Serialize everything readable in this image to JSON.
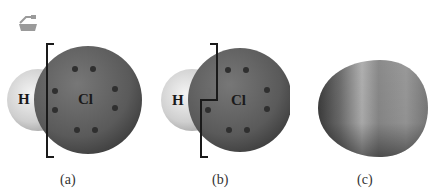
{
  "figure": {
    "logo_icon": "flask-logo-icon",
    "panels": [
      {
        "id": "a",
        "caption": "(a)",
        "atoms": {
          "left": "H",
          "right": "Cl"
        },
        "description": "HCl space-filling model with bracket around Cl; 8 electron dots on Cl"
      },
      {
        "id": "b",
        "caption": "(b)",
        "atoms": {
          "left": "H",
          "right": "Cl"
        },
        "description": "HCl model with stepped bracket including shared electron pair"
      },
      {
        "id": "c",
        "caption": "(c)",
        "description": "Electron density surface of HCl molecule"
      }
    ]
  },
  "colors": {
    "hydrogen": "#d6d6d6",
    "chlorine": "#5e5e5e",
    "dots": "#2f2f2f",
    "bracket": "#1a1a1a",
    "surface_dark": "#555555",
    "surface_light": "#a8a8a8"
  }
}
